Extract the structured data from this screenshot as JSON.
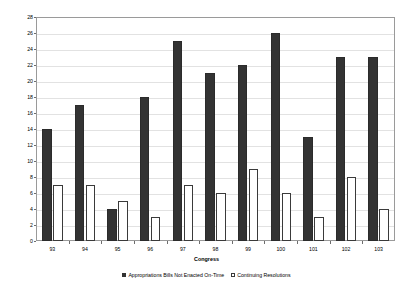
{
  "chart_data": {
    "type": "bar",
    "title": "",
    "xlabel": "Congress",
    "ylabel": "Number of Bills",
    "categories": [
      "93",
      "94",
      "95",
      "96",
      "97",
      "98",
      "99",
      "100",
      "101",
      "102",
      "103"
    ],
    "series": [
      {
        "name": "Appropriations Bills Not Enacted On-Time",
        "color": "#333333",
        "values": [
          14,
          17,
          4,
          18,
          25,
          21,
          22,
          26,
          13,
          23,
          23
        ]
      },
      {
        "name": "Continuing Resolutions",
        "color": "#ffffff",
        "values": [
          7,
          7,
          5,
          3,
          7,
          6,
          9,
          6,
          3,
          8,
          4
        ]
      }
    ],
    "ylim": [
      0,
      28
    ],
    "ytick_step": 2,
    "yticks": [
      0,
      2,
      4,
      6,
      8,
      10,
      12,
      14,
      16,
      18,
      20,
      22,
      24,
      26,
      28
    ],
    "grid": true,
    "legend_position": "bottom"
  },
  "legend": {
    "items": [
      {
        "label": "Appropriations Bills Not Enacted On-Time",
        "swatch": "dark"
      },
      {
        "label": "Continuing Resolutions",
        "swatch": "light"
      }
    ]
  },
  "colors": {
    "series_dark": "#333333",
    "series_light": "#ffffff",
    "gridline": "#e2e2e2",
    "frame": "#9a9a9a",
    "background": "#ffffff"
  }
}
